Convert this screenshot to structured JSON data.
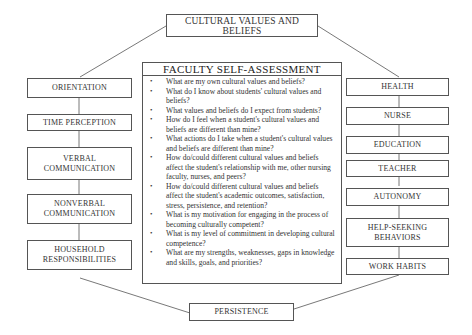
{
  "diagram": {
    "top_node": "CULTURAL VALUES AND BELIEFS",
    "bottom_node": "PERSISTENCE",
    "center": {
      "title": "FACULTY SELF-ASSESSMENT",
      "questions": [
        "What are my own cultural values and beliefs?",
        "What do I know about students' cultural values and beliefs?",
        "What values and beliefs do I expect from students?",
        "How do I feel when a student's cultural values and beliefs are different than mine?",
        "What actions do I take when a student's cultural values and beliefs are different than mine?",
        "How do/could different cultural values and beliefs affect the student's relationship with me, other nursing faculty, nurses, and peers?",
        "How do/could different cultural values and beliefs affect the student's academic outcomes, satisfaction, stress, persistence, and retention?",
        "What is my motivation for engaging in the process of becoming culturally competent?",
        "What is my level of commitment in developing cultural competence?",
        "What are my strengths, weaknesses, gaps in knowledge and skills, goals, and priorities?"
      ]
    },
    "left_nodes": [
      "ORIENTATION",
      "TIME PERCEPTION",
      "VERBAL COMMUNICATION",
      "NONVERBAL COMMUNICATION",
      "HOUSEHOLD RESPONSIBILITIES"
    ],
    "right_nodes": [
      "HEALTH",
      "NURSE",
      "EDUCATION",
      "TEACHER",
      "AUTONOMY",
      "HELP-SEEKING BEHAVIORS",
      "WORK HABITS"
    ],
    "bullet_glyph": "•"
  }
}
